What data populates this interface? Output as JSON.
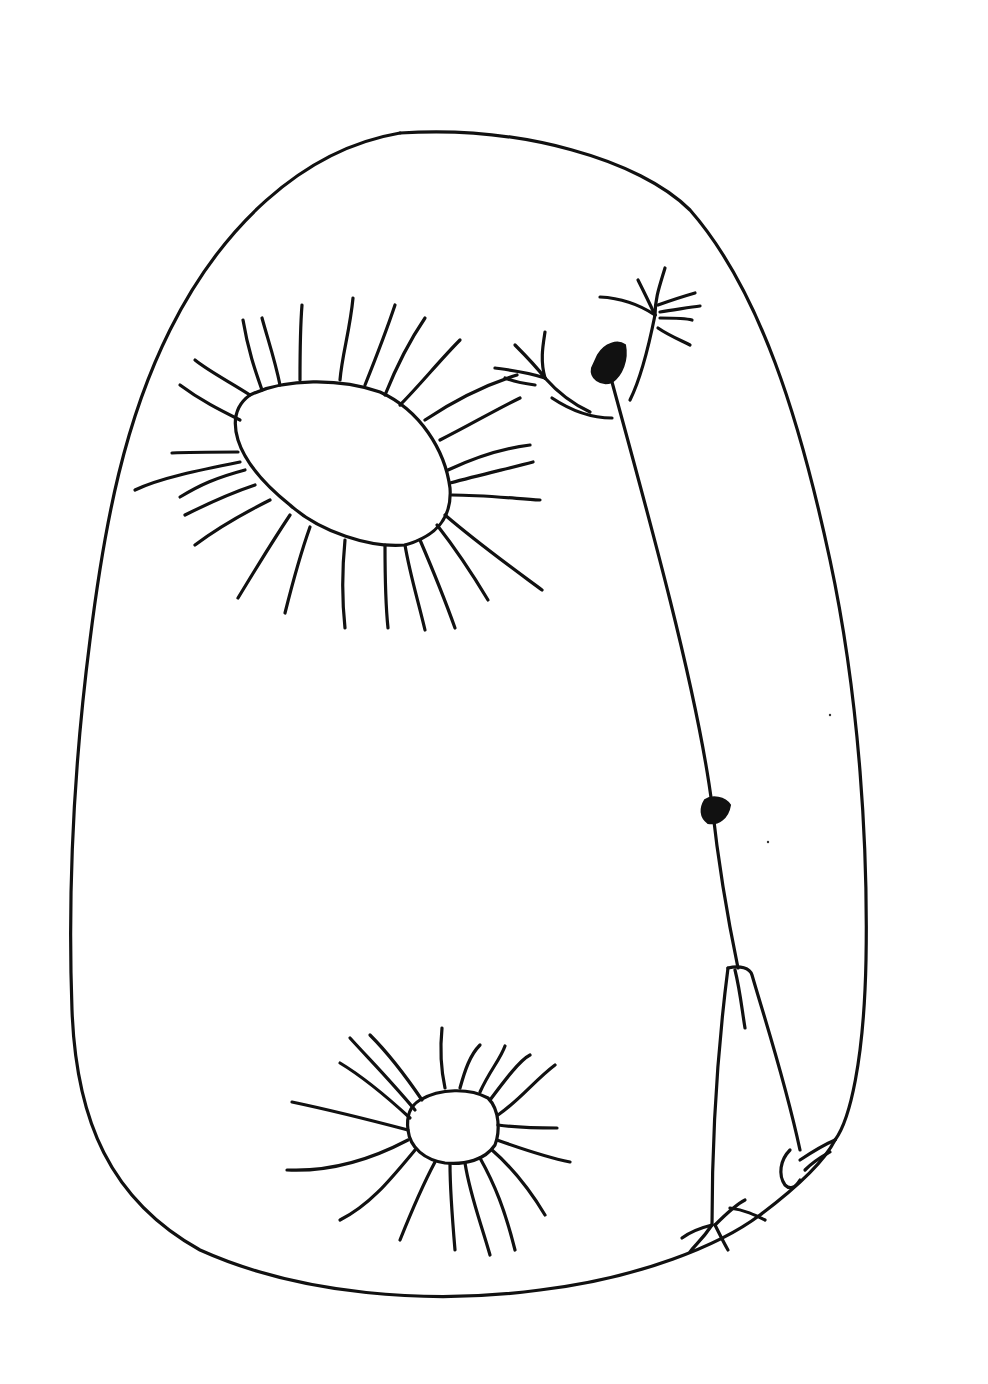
{
  "figure": {
    "stroke_color": "#111111",
    "background_color": "#ffffff",
    "elements": [
      "outer-body-outline",
      "upper-left-radiating-opening",
      "lower-radiating-opening",
      "stalk-with-dark-node",
      "branching-tufts",
      "cone-structure",
      "base-claws"
    ]
  }
}
